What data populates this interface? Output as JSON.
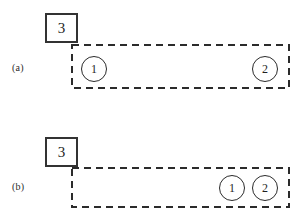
{
  "figure": {
    "background_color": "#ffffff",
    "stroke_color": "#2b2b2b",
    "box_stroke_color": "#333333",
    "panels": [
      {
        "id": "a",
        "label": "(a)",
        "label_x": 12,
        "label_y": 62,
        "outside_box": {
          "label": "3",
          "x": 45,
          "y": 13,
          "width": 33,
          "height": 30
        },
        "region": {
          "name": "dashed-region",
          "x": 71,
          "y": 44,
          "width": 219,
          "height": 45
        },
        "nodes": [
          {
            "label": "1",
            "cx": 94,
            "cy": 69,
            "diameter": 26
          },
          {
            "label": "2",
            "cx": 265,
            "cy": 69,
            "diameter": 26
          }
        ]
      },
      {
        "id": "b",
        "label": "(b)",
        "label_x": 12,
        "label_y": 181,
        "outside_box": {
          "label": "3",
          "x": 45,
          "y": 137,
          "width": 33,
          "height": 30
        },
        "region": {
          "name": "dashed-region",
          "x": 71,
          "y": 167,
          "width": 219,
          "height": 41
        },
        "nodes": [
          {
            "label": "1",
            "cx": 232,
            "cy": 188,
            "diameter": 26
          },
          {
            "label": "2",
            "cx": 265,
            "cy": 188,
            "diameter": 26
          }
        ]
      }
    ]
  }
}
